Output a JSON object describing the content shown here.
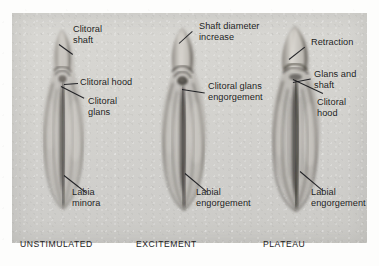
{
  "figure": {
    "background_color": "#fdfdfc",
    "plate_color": "#d6d5d1",
    "text_color": "#1b1b1b",
    "leader_color": "#15161a"
  },
  "panels": [
    {
      "id": "unstimulated",
      "stage_caption": "UNSTIMULATED",
      "callouts": [
        {
          "name": "clitoral-shaft",
          "text": "Clitoral\nshaft"
        },
        {
          "name": "clitoral-hood",
          "text": "Clitoral hood"
        },
        {
          "name": "clitoral-glans",
          "text": "Clitoral\nglans"
        },
        {
          "name": "labia-minora",
          "text": "Labia\nminora"
        }
      ]
    },
    {
      "id": "excitement",
      "stage_caption": "EXCITEMENT",
      "callouts": [
        {
          "name": "shaft-diameter-increase",
          "text": "Shaft diameter\nincrease"
        },
        {
          "name": "clitoral-glans-engorgement",
          "text": "Clitoral glans\nengorgement"
        },
        {
          "name": "labial-engorgement",
          "text": "Labial\nengorgement"
        }
      ]
    },
    {
      "id": "plateau",
      "stage_caption": "PLATEAU",
      "callouts": [
        {
          "name": "retraction",
          "text": "Retraction"
        },
        {
          "name": "glans-and-shaft",
          "text": "Glans and\nshaft"
        },
        {
          "name": "clitoral-hood",
          "text": "Clitoral\nhood"
        },
        {
          "name": "labial-engorgement",
          "text": "Labial\nengorgement"
        }
      ]
    }
  ]
}
